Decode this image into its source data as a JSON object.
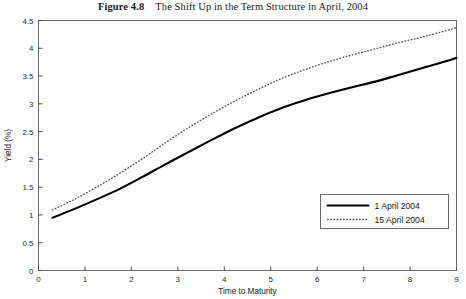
{
  "figure": {
    "label": "Figure 4.8",
    "caption": "The Shift Up in the Term Structure in April, 2004"
  },
  "chart_data": {
    "type": "line",
    "title": "The Shift Up in the Term Structure in April, 2004",
    "xlabel": "Time to Maturity",
    "ylabel": "Yield (%)",
    "xlim": [
      0,
      9
    ],
    "ylim": [
      0,
      4.5
    ],
    "xticks": [
      0,
      1,
      2,
      3,
      4,
      5,
      6,
      7,
      8,
      9
    ],
    "xticklabels": [
      "0",
      "1",
      "2",
      "3",
      "4",
      "5",
      "6",
      "7",
      "8",
      "9"
    ],
    "yticks": [
      0,
      0.5,
      1,
      1.5,
      2,
      2.5,
      3,
      3.5,
      4,
      4.5
    ],
    "yticklabels": [
      "0",
      "0.5",
      "1",
      "1.5",
      "2",
      "2.5",
      "3",
      "3.5",
      "4",
      "4.5"
    ],
    "grid": false,
    "legend_position": "lower right",
    "series": [
      {
        "name": "1 April 2004",
        "style": "solid",
        "color": "#000000",
        "x": [
          0.3,
          0.75,
          1.25,
          1.75,
          2.25,
          2.75,
          3.25,
          3.75,
          4.25,
          4.75,
          5.25,
          5.75,
          6.25,
          6.75,
          7.25,
          7.75,
          8.25,
          8.75,
          9.0
        ],
        "y": [
          0.95,
          1.1,
          1.28,
          1.47,
          1.69,
          1.92,
          2.14,
          2.36,
          2.57,
          2.76,
          2.93,
          3.07,
          3.19,
          3.3,
          3.4,
          3.52,
          3.64,
          3.76,
          3.83
        ]
      },
      {
        "name": "15 April 2004",
        "style": "dotted",
        "color": "#555555",
        "x": [
          0.3,
          0.75,
          1.25,
          1.75,
          2.25,
          2.75,
          3.25,
          3.75,
          4.25,
          4.75,
          5.25,
          5.75,
          6.25,
          6.75,
          7.25,
          7.75,
          8.25,
          8.75,
          9.0
        ],
        "y": [
          1.09,
          1.27,
          1.5,
          1.75,
          2.02,
          2.31,
          2.58,
          2.83,
          3.06,
          3.27,
          3.46,
          3.62,
          3.76,
          3.88,
          3.99,
          4.1,
          4.2,
          4.31,
          4.37
        ]
      }
    ]
  },
  "legend": {
    "items": [
      {
        "label": "1 April 2004",
        "style": "solid"
      },
      {
        "label": "15 April 2004",
        "style": "dotted"
      }
    ]
  }
}
